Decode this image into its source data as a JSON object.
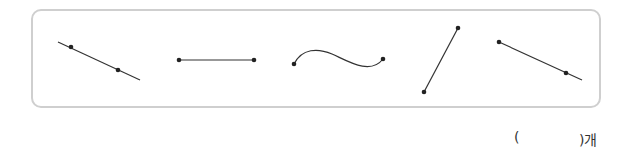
{
  "problem": {
    "figures": [
      {
        "type": "line",
        "label": "line-through-two-points"
      },
      {
        "type": "segment",
        "label": "straight-segment"
      },
      {
        "type": "curve",
        "label": "curved-line"
      },
      {
        "type": "segment",
        "label": "slanted-segment"
      },
      {
        "type": "ray",
        "label": "ray"
      }
    ],
    "answer": {
      "open_paren": "(",
      "close_paren": ")개"
    },
    "colors": {
      "stroke": "#333333",
      "border": "#cfcfcf"
    }
  }
}
